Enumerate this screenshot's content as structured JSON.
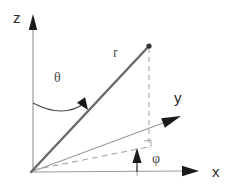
{
  "figure": {
    "background_color": "#ffffff"
  },
  "colors": {
    "axis_line": "#9a9a9a",
    "axis_arrow": "#1a1a1a",
    "radius_line": "#6a6a6a",
    "dashed_line": "#a8a8a8",
    "label_dark": "#2b2b2b",
    "label_gray": "#4a4a4a",
    "point_dot": "#333333"
  },
  "axes": [
    {
      "id": "z",
      "label": "z",
      "label_x": 13,
      "label_y": 23,
      "from": {
        "x": 33,
        "y": 172
      },
      "to": {
        "x": 33,
        "y": 30
      },
      "arrow_tip": {
        "x": 33,
        "y": 14
      },
      "direction": "up"
    },
    {
      "id": "y",
      "label": "y",
      "label_x": 174,
      "label_y": 103,
      "from": {
        "x": 31,
        "y": 172
      },
      "to": {
        "x": 163,
        "y": 123
      },
      "arrow_tip": {
        "x": 181,
        "y": 116
      },
      "direction": "up-right"
    },
    {
      "id": "x",
      "label": "x",
      "label_x": 212,
      "label_y": 177,
      "from": {
        "x": 31,
        "y": 172
      },
      "to": {
        "x": 182,
        "y": 171
      },
      "arrow_tip": {
        "x": 199,
        "y": 171
      },
      "direction": "right"
    }
  ],
  "radius": {
    "label": "r",
    "label_x": 113,
    "label_y": 57,
    "from": {
      "x": 31,
      "y": 172
    },
    "to": {
      "x": 149,
      "y": 46
    },
    "endpoint_dot": {
      "x": 149,
      "y": 46,
      "radius": 2.6
    }
  },
  "angles": [
    {
      "id": "theta",
      "label": "θ",
      "label_x": 54,
      "label_y": 82,
      "arc_from": {
        "x": 33,
        "y": 103
      },
      "arc_to": {
        "x": 85,
        "y": 103
      },
      "arrow_tip": {
        "x": 88,
        "y": 110
      },
      "description": "polar angle from z-axis to r"
    },
    {
      "id": "phi",
      "label": "φ",
      "label_x": 152,
      "label_y": 163,
      "arrow_from": {
        "x": 137,
        "y": 172
      },
      "arrow_tip": {
        "x": 137,
        "y": 148
      },
      "description": "azimuthal angle from x-axis in xy-plane"
    }
  ],
  "dashed_lines": [
    {
      "id": "vertical-drop",
      "from": {
        "x": 149,
        "y": 48
      },
      "to": {
        "x": 149,
        "y": 148
      },
      "description": "vertical drop from point to xy-plane"
    },
    {
      "id": "xy-projection",
      "from": {
        "x": 33,
        "y": 170
      },
      "to": {
        "x": 148,
        "y": 147
      },
      "description": "projection of r onto xy-plane"
    }
  ],
  "markers": [
    {
      "id": "right-angle",
      "corner_x": 151,
      "corner_y": 147,
      "size": 7,
      "description": "right angle marker at projection foot"
    },
    {
      "id": "x-axis-tick",
      "x": 137,
      "y_top": 166,
      "y_bottom": 176,
      "description": "small tick on x-axis below phi arrow"
    }
  ]
}
